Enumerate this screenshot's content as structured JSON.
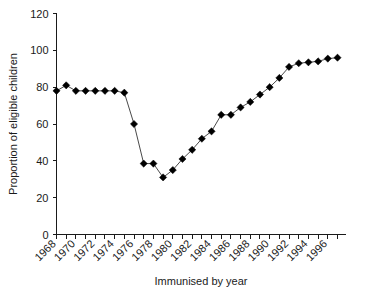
{
  "chart_data": {
    "type": "line",
    "title": "",
    "subtitle": "",
    "xlabel": "Immunised by year",
    "ylabel": "Proportion of eligible children",
    "xlim": [
      1967.5,
      1997.5
    ],
    "ylim": [
      0,
      120
    ],
    "grid": false,
    "legend": null,
    "marker": "filled-diamond",
    "line_color": "#1a1a1a",
    "marker_color": "#000000",
    "y_ticks": [
      0,
      20,
      40,
      60,
      80,
      100,
      120
    ],
    "y_tick_labels": [
      "0",
      "20",
      "40",
      "60",
      "80",
      "100",
      "120"
    ],
    "x_ticks": [
      1968,
      1969,
      1970,
      1971,
      1972,
      1973,
      1974,
      1975,
      1976,
      1977,
      1978,
      1979,
      1980,
      1981,
      1982,
      1983,
      1984,
      1985,
      1986,
      1987,
      1988,
      1989,
      1990,
      1991,
      1992,
      1993,
      1994,
      1995,
      1996,
      1997
    ],
    "x_tick_labels_shown": [
      "1968",
      "1970",
      "1972",
      "1974",
      "1976",
      "1978",
      "1980",
      "1982",
      "1984",
      "1986",
      "1988",
      "1990",
      "1992",
      "1994",
      "1996"
    ],
    "x": [
      1968,
      1969,
      1970,
      1971,
      1972,
      1973,
      1974,
      1975,
      1976,
      1977,
      1978,
      1979,
      1980,
      1981,
      1982,
      1983,
      1984,
      1985,
      1986,
      1987,
      1988,
      1989,
      1990,
      1991,
      1992,
      1993,
      1994,
      1995,
      1996,
      1997
    ],
    "values": [
      78,
      81,
      78,
      78,
      78,
      78,
      78,
      77,
      60,
      38.5,
      38.5,
      31,
      35,
      41,
      46,
      52,
      56,
      65,
      65,
      69,
      72,
      76,
      80,
      85,
      91,
      93,
      93.5,
      94,
      95.5,
      96
    ],
    "series": [
      {
        "name": "Proportion of eligible children immunised",
        "values": [
          78,
          81,
          78,
          78,
          78,
          78,
          78,
          77,
          60,
          38.5,
          38.5,
          31,
          35,
          41,
          46,
          52,
          56,
          65,
          65,
          69,
          72,
          76,
          80,
          85,
          91,
          93,
          93.5,
          94,
          95.5,
          96
        ]
      }
    ]
  },
  "axes": {
    "y_title": "Proportion of eligible children",
    "x_title": "Immunised by year"
  }
}
